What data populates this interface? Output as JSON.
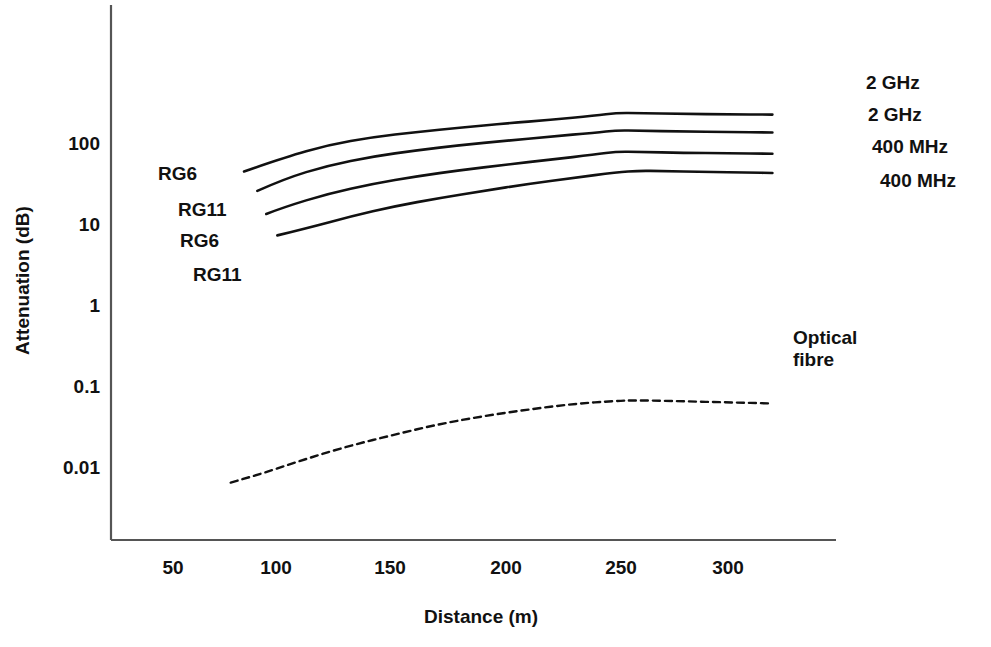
{
  "chart_data": {
    "type": "line",
    "title": "",
    "xlabel": "Distance (m)",
    "ylabel": "Attenuation (dB)",
    "xlim": [
      30,
      330
    ],
    "ylim": [
      0.004,
      700
    ],
    "yscale": "log",
    "xscale": "linear",
    "grid": false,
    "legend_position": "inline-labels",
    "x_ticks": [
      "50",
      "100",
      "150",
      "200",
      "250",
      "300"
    ],
    "x_tick_values": [
      50,
      100,
      150,
      200,
      250,
      300
    ],
    "y_ticks": [
      "100",
      "10",
      "1",
      "0.1",
      "0.01"
    ],
    "y_tick_values": [
      100,
      10,
      1,
      0.1,
      0.01
    ],
    "series": [
      {
        "name": "RG6 2 GHz",
        "left_label": "RG6",
        "right_label": "2 GHz",
        "style": "solid",
        "x": [
          82,
          100,
          120,
          140,
          160,
          180,
          200,
          220,
          240,
          250,
          260,
          280,
          300,
          320
        ],
        "values": [
          47,
          70,
          100,
          125,
          145,
          165,
          185,
          205,
          230,
          250,
          248,
          243,
          240,
          238
        ]
      },
      {
        "name": "RG11 2 GHz",
        "left_label": "RG11",
        "right_label": "2 GHz",
        "style": "solid",
        "x": [
          88,
          100,
          120,
          140,
          160,
          180,
          200,
          220,
          240,
          250,
          260,
          280,
          300,
          320
        ],
        "values": [
          27,
          38,
          56,
          72,
          86,
          100,
          113,
          127,
          142,
          152,
          150,
          147,
          145,
          143
        ]
      },
      {
        "name": "RG6 400 MHz",
        "left_label": "RG6",
        "right_label": "400 MHz",
        "style": "solid",
        "x": [
          92,
          100,
          120,
          140,
          160,
          180,
          200,
          220,
          240,
          250,
          260,
          280,
          300,
          320
        ],
        "values": [
          14,
          17,
          25,
          33,
          41,
          49,
          57,
          66,
          76,
          83,
          82,
          80,
          79,
          78
        ]
      },
      {
        "name": "RG11 400 MHz",
        "left_label": "RG11",
        "right_label": "400 MHz",
        "style": "solid",
        "x": [
          97,
          110,
          130,
          150,
          170,
          190,
          210,
          230,
          250,
          260,
          270,
          290,
          310,
          320
        ],
        "values": [
          7.6,
          9.3,
          13,
          17.5,
          22,
          27,
          33,
          39,
          46,
          48,
          47.5,
          46.5,
          45.5,
          45
        ]
      },
      {
        "name": "Optical fibre",
        "left_label": "",
        "right_label": "Optical fibre",
        "style": "dashed",
        "x": [
          76,
          90,
          110,
          130,
          150,
          170,
          190,
          210,
          230,
          250,
          260,
          280,
          300,
          320
        ],
        "values": [
          0.0066,
          0.0085,
          0.013,
          0.019,
          0.026,
          0.035,
          0.044,
          0.053,
          0.062,
          0.068,
          0.069,
          0.067,
          0.065,
          0.063
        ]
      }
    ],
    "inline_labels_left": [
      {
        "text": "RG6",
        "x_px": 158,
        "y_px": 163
      },
      {
        "text": "RG11",
        "x_px": 178,
        "y_px": 199
      },
      {
        "text": "RG6",
        "x_px": 180,
        "y_px": 230
      },
      {
        "text": "RG11",
        "x_px": 193,
        "y_px": 264
      }
    ],
    "inline_labels_right": [
      {
        "text": "2 GHz",
        "x_px": 866,
        "y_px": 72
      },
      {
        "text": "2 GHz",
        "x_px": 868,
        "y_px": 104
      },
      {
        "text": "400 MHz",
        "x_px": 872,
        "y_px": 136
      },
      {
        "text": "400 MHz",
        "x_px": 880,
        "y_px": 170
      }
    ],
    "optical_label": {
      "line1": "Optical",
      "line2": "fibre",
      "x_px": 793,
      "y_px": 327
    },
    "colors": {
      "line": "#111111",
      "axis": "#555555",
      "background": "#ffffff"
    }
  },
  "axes": {
    "x_title": "Distance (m)",
    "y_title": "Attenuation (dB)",
    "x_tick_labels": [
      "50",
      "100",
      "150",
      "200",
      "250",
      "300"
    ],
    "y_tick_labels": [
      "100",
      "10",
      "1",
      "0.1",
      "0.01"
    ]
  }
}
